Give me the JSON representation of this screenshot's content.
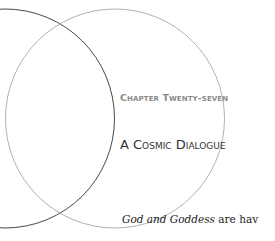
{
  "chapter": {
    "label": "Chapter Twenty-seven",
    "title": "A Cosmic Dialogue"
  },
  "body": {
    "emphasis": "God and Goddess",
    "rest": " are hav"
  },
  "ornament": {
    "name": "vesica-piscis-circles",
    "dark_color": "#333333",
    "light_color": "#a8a8a8"
  }
}
